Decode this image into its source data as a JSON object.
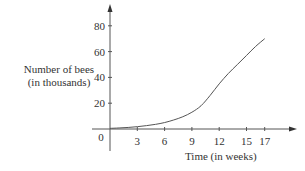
{
  "chart_data": {
    "type": "line",
    "title": "",
    "xlabel": "Time (in weeks)",
    "ylabel_line1": "Number of bees",
    "ylabel_line2": "(in thousands)",
    "x_ticks": [
      3,
      6,
      9,
      12,
      15,
      17
    ],
    "y_ticks": [
      20,
      40,
      60,
      80
    ],
    "origin_label": "0",
    "xlim": [
      0,
      20
    ],
    "ylim": [
      0,
      90
    ],
    "grid": false,
    "legend": null,
    "series": [
      {
        "name": "Number of bees",
        "x": [
          0,
          1,
          2,
          3,
          4,
          5,
          6,
          7,
          8,
          9,
          10,
          11,
          12,
          13,
          14,
          15,
          16,
          17
        ],
        "values": [
          0.5,
          0.8,
          1.2,
          1.8,
          2.6,
          3.6,
          5,
          7,
          9.5,
          13,
          18,
          26,
          35,
          43,
          50,
          57,
          64,
          70
        ]
      }
    ]
  }
}
